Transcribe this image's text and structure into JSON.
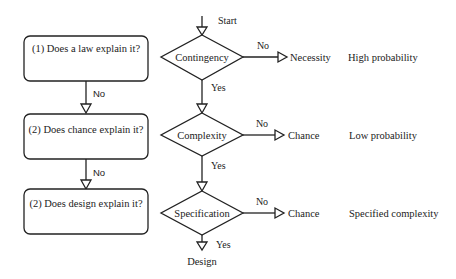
{
  "left_column": {
    "boxes": [
      {
        "label": "(1) Does a law explain it?"
      },
      {
        "label": "(2) Does chance explain it?"
      },
      {
        "label": "(2) Does design explain it?"
      }
    ],
    "connectors": [
      {
        "label": "No"
      },
      {
        "label": "No"
      }
    ]
  },
  "flow": {
    "start_label": "Start",
    "decisions": [
      {
        "label": "Contingency",
        "no_label": "No",
        "no_outcome": "Necessity",
        "probability": "High probability",
        "yes_label": "Yes"
      },
      {
        "label": "Complexity",
        "no_label": "No",
        "no_outcome": "Chance",
        "probability": "Low probability",
        "yes_label": "Yes"
      },
      {
        "label": "Specification",
        "no_label": "No",
        "no_outcome": "Chance",
        "probability": "Specified complexity",
        "yes_label": "Yes"
      }
    ],
    "end_label": "Design"
  },
  "colors": {
    "stroke": "#222222",
    "background": "#ffffff"
  }
}
